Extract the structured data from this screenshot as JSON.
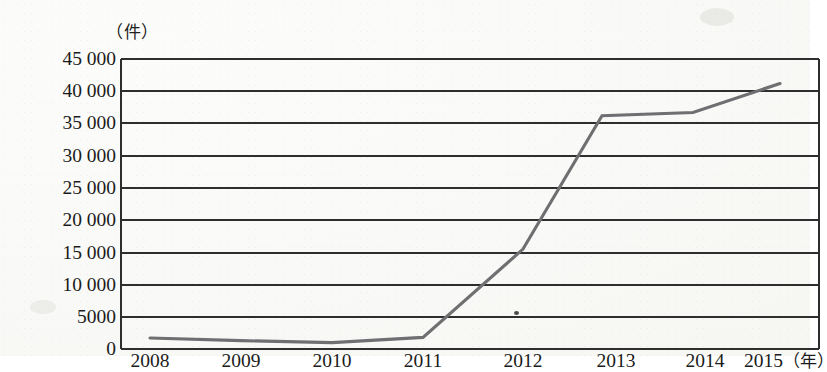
{
  "chart_data": {
    "type": "line",
    "title": "",
    "subtitle": "",
    "xlabel": "年",
    "ylabel": "件",
    "y_unit_label": "（件）",
    "x_unit_label": "（年）",
    "categories": [
      "2008",
      "2009",
      "2010",
      "2011",
      "2012",
      "2013",
      "2014",
      "2015"
    ],
    "x_tick_labels": [
      "2008",
      "2009",
      "2010",
      "2011",
      "2012",
      "2013",
      "2014",
      "2015(年)"
    ],
    "values": [
      1700,
      1300,
      1000,
      1800,
      15500,
      36200,
      36700,
      41200
    ],
    "series": [
      {
        "name": "件数",
        "values": [
          1700,
          1300,
          1000,
          1800,
          15500,
          36200,
          36700,
          41200
        ]
      }
    ],
    "ylim": [
      0,
      45000
    ],
    "xlim": [
      "2008",
      "2015"
    ],
    "y_ticks": [
      0,
      5000,
      10000,
      15000,
      20000,
      25000,
      30000,
      35000,
      40000,
      45000
    ],
    "y_tick_labels": [
      "0",
      "5000",
      "10 000",
      "15 000",
      "20 000",
      "25 000",
      "30 000",
      "35 000",
      "40 000",
      "45 000"
    ],
    "grid": true,
    "grid_axis": "y",
    "legend": false,
    "legend_position": "none",
    "line_color": "#6f6f72",
    "grid_color": "#2e2e2e",
    "axis_color": "#2e2e2e",
    "background_color": "#f8f8f6",
    "marker": "none",
    "annotations": []
  }
}
